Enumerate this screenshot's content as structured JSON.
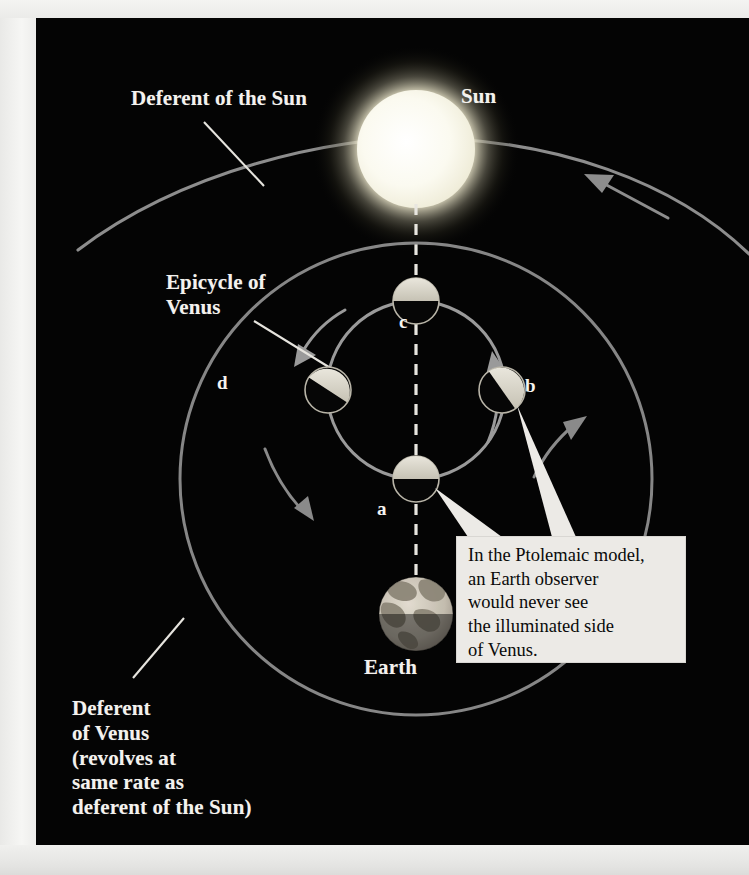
{
  "figure": {
    "kind": "astronomy-diagram",
    "background_color": "#040404",
    "orbit_color": "#8c8c8c",
    "label_color": "#f4f2ee"
  },
  "labels": {
    "deferent_of_sun": "Deferent of the Sun",
    "sun": "Sun",
    "epicycle_of_venus": "Epicycle of\nVenus",
    "earth": "Earth",
    "deferent_of_venus": "Deferent\nof Venus\n(revolves at\nsame rate as\ndeferent of the Sun)"
  },
  "callout": {
    "text": "In the Ptolemaic model,\nan Earth observer\nwould never see\nthe illuminated side\nof Venus.",
    "background_color": "#eceae6",
    "text_color": "#0a0a0a",
    "points_to": [
      "a",
      "b"
    ]
  },
  "bodies": {
    "sun": {
      "name": "Sun",
      "center": [
        380,
        131
      ],
      "radius": 59,
      "glow_radius": 104,
      "color": "#fdfcf0"
    },
    "earth": {
      "name": "Earth",
      "center": [
        380,
        596
      ],
      "radius": 37,
      "lit_half": "top",
      "color": "#cfc9bd"
    }
  },
  "venus_positions": [
    {
      "id": "a",
      "label": "a",
      "center": [
        380,
        461
      ],
      "radius": 23,
      "lit_direction_deg": 90,
      "description": "nearest Earth, lit side faces away from Earth toward the Sun"
    },
    {
      "id": "b",
      "label": "b",
      "center": [
        466,
        372
      ],
      "radius": 23,
      "lit_direction_deg": 125,
      "description": "right of epicycle, lit crescent faces up-left toward the Sun"
    },
    {
      "id": "c",
      "label": "c",
      "center": [
        380,
        283
      ],
      "radius": 23,
      "lit_direction_deg": 90,
      "description": "farthest from Earth, lit half faces up toward the Sun"
    },
    {
      "id": "d",
      "label": "d",
      "center": [
        292,
        372
      ],
      "radius": 23,
      "lit_direction_deg": 55,
      "description": "left of epicycle, lit crescent faces up-right toward the Sun"
    }
  ],
  "orbits": [
    {
      "id": "deferent-of-sun",
      "name": "Deferent of the Sun",
      "type": "arc",
      "stroke": "#909090",
      "direction": "counterclockwise"
    },
    {
      "id": "deferent-of-venus",
      "name": "Deferent of Venus",
      "type": "circle",
      "center": [
        380,
        461
      ],
      "radius": 236,
      "stroke": "#8a8a8a",
      "direction": "counterclockwise"
    },
    {
      "id": "epicycle-of-venus",
      "name": "Epicycle of Venus",
      "type": "circle",
      "center": [
        380,
        372
      ],
      "radius": 89,
      "stroke": "#9a9a9a",
      "direction": "counterclockwise"
    }
  ],
  "sight_line": {
    "id": "earth-sun-sight-line",
    "style": "dashed",
    "color": "#e8e6e0",
    "from": "Sun",
    "through": [
      "c",
      "a"
    ],
    "to": "Earth"
  },
  "direction_arrows": [
    {
      "id": "arrow-deferent-sun",
      "on": "deferent-of-sun",
      "direction": "counterclockwise"
    },
    {
      "id": "arrow-epicycle-left",
      "on": "epicycle-of-venus",
      "direction": "counterclockwise"
    },
    {
      "id": "arrow-epicycle-right",
      "on": "epicycle-of-venus",
      "direction": "counterclockwise"
    },
    {
      "id": "arrow-deferent-venus-left",
      "on": "deferent-of-venus",
      "direction": "counterclockwise"
    },
    {
      "id": "arrow-deferent-venus-right",
      "on": "deferent-of-venus",
      "direction": "counterclockwise"
    }
  ],
  "leader_lines": [
    {
      "id": "leader-deferent-sun",
      "from_label": "Deferent of the Sun",
      "to": "deferent-of-sun"
    },
    {
      "id": "leader-epicycle-venus",
      "from_label": "Epicycle of Venus",
      "to": "epicycle-of-venus"
    },
    {
      "id": "leader-deferent-venus",
      "from_label": "Deferent of Venus",
      "to": "deferent-of-venus"
    }
  ]
}
